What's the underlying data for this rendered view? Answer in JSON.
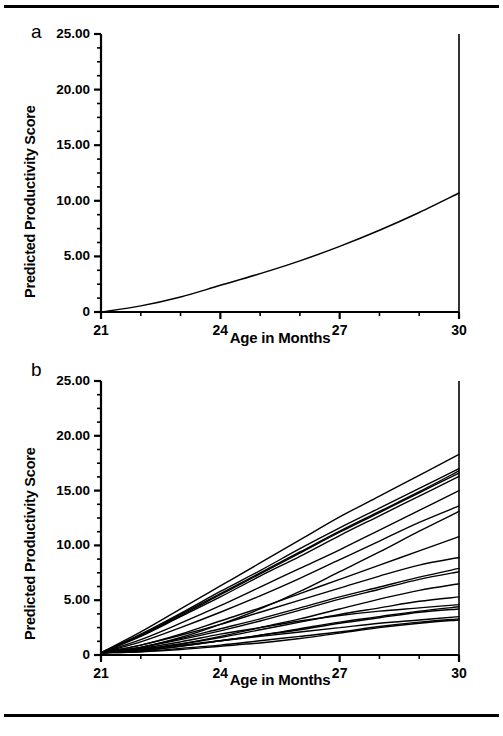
{
  "figure": {
    "panel_a_letter": "a",
    "panel_b_letter": "b"
  },
  "chart_data": [
    {
      "type": "line",
      "panel": "a",
      "title": "",
      "xlabel": "Age in Months",
      "ylabel": "Predicted Productivity Score",
      "xlim": [
        21,
        30
      ],
      "ylim": [
        0,
        25
      ],
      "xticks": [
        21,
        24,
        27,
        30
      ],
      "xtick_labels": [
        "21",
        "24",
        "27",
        "30"
      ],
      "yticks": [
        0,
        5,
        10,
        15,
        20,
        25
      ],
      "ytick_labels": [
        "0",
        "5.00",
        "10.00",
        "15.00",
        "20.00",
        "25.00"
      ],
      "minor_ytick_step": 1.25,
      "grid": false,
      "legend": "none",
      "series": [
        {
          "name": "Mean predicted productivity",
          "x": [
            21,
            22,
            23,
            24,
            25,
            26,
            27,
            28,
            29,
            30
          ],
          "values": [
            0.0,
            0.55,
            1.35,
            2.4,
            3.45,
            4.6,
            5.9,
            7.35,
            8.95,
            10.7
          ]
        }
      ]
    },
    {
      "type": "line",
      "panel": "b",
      "title": "",
      "xlabel": "Age in Months",
      "ylabel": "Predicted Productivity Score",
      "xlim": [
        21,
        30
      ],
      "ylim": [
        0,
        25
      ],
      "xticks": [
        21,
        24,
        27,
        30
      ],
      "xtick_labels": [
        "21",
        "24",
        "27",
        "30"
      ],
      "yticks": [
        0,
        5,
        10,
        15,
        20,
        25
      ],
      "ytick_labels": [
        "0",
        "5.00",
        "10.00",
        "15.00",
        "20.00",
        "25.00"
      ],
      "minor_ytick_step": 1.25,
      "grid": false,
      "legend": "none",
      "x": [
        21,
        22,
        23,
        24,
        25,
        26,
        27,
        28,
        29,
        30
      ],
      "series": [
        {
          "name": "child-01",
          "values": [
            0.2,
            2.1,
            4.2,
            6.3,
            8.4,
            10.5,
            12.6,
            14.5,
            16.4,
            18.3
          ]
        },
        {
          "name": "child-02",
          "values": [
            0.2,
            1.9,
            3.8,
            5.8,
            7.7,
            9.7,
            11.6,
            13.4,
            15.2,
            17.0
          ]
        },
        {
          "name": "child-03",
          "values": [
            0.2,
            1.8,
            3.7,
            5.6,
            7.5,
            9.4,
            11.3,
            13.1,
            14.9,
            16.8
          ]
        },
        {
          "name": "child-04",
          "values": [
            0.2,
            1.8,
            3.6,
            5.5,
            7.4,
            9.3,
            11.2,
            13.0,
            14.8,
            16.6
          ]
        },
        {
          "name": "child-05",
          "values": [
            0.2,
            1.7,
            3.5,
            5.3,
            7.2,
            9.0,
            10.9,
            12.7,
            14.5,
            16.3
          ]
        },
        {
          "name": "child-06",
          "values": [
            0.2,
            1.4,
            2.9,
            4.5,
            6.2,
            7.9,
            9.6,
            11.4,
            13.2,
            15.0
          ]
        },
        {
          "name": "child-07",
          "values": [
            0.2,
            1.2,
            2.5,
            3.9,
            5.4,
            7.0,
            8.7,
            10.4,
            12.1,
            13.6
          ]
        },
        {
          "name": "child-08",
          "values": [
            0.2,
            0.7,
            1.6,
            2.8,
            4.2,
            5.8,
            7.6,
            9.4,
            11.3,
            13.1
          ]
        },
        {
          "name": "child-09",
          "values": [
            0.2,
            0.9,
            1.9,
            3.1,
            4.3,
            5.6,
            6.9,
            8.2,
            9.5,
            10.8
          ]
        },
        {
          "name": "child-10",
          "values": [
            0.2,
            0.9,
            1.8,
            2.8,
            3.9,
            5.0,
            6.1,
            7.2,
            8.2,
            8.9
          ]
        },
        {
          "name": "child-11",
          "values": [
            0.2,
            0.7,
            1.5,
            2.4,
            3.3,
            4.3,
            5.3,
            6.2,
            7.1,
            7.9
          ]
        },
        {
          "name": "child-12",
          "values": [
            0.2,
            0.7,
            1.4,
            2.2,
            3.1,
            4.1,
            5.1,
            6.0,
            6.9,
            7.6
          ]
        },
        {
          "name": "child-13",
          "values": [
            0.2,
            0.5,
            1.0,
            1.7,
            2.5,
            3.3,
            4.2,
            5.1,
            5.9,
            6.5
          ]
        },
        {
          "name": "child-14",
          "values": [
            0.2,
            0.5,
            1.0,
            1.6,
            2.3,
            3.0,
            3.7,
            4.3,
            4.9,
            5.3
          ]
        },
        {
          "name": "child-15",
          "values": [
            0.2,
            0.6,
            1.2,
            1.9,
            2.5,
            3.1,
            3.6,
            4.0,
            4.3,
            4.6
          ]
        },
        {
          "name": "child-16",
          "values": [
            0.2,
            0.4,
            0.8,
            1.3,
            1.8,
            2.4,
            3.0,
            3.5,
            4.0,
            4.4
          ]
        },
        {
          "name": "child-17",
          "values": [
            0.2,
            0.4,
            0.8,
            1.3,
            1.8,
            2.3,
            2.9,
            3.4,
            3.9,
            4.2
          ]
        },
        {
          "name": "child-18",
          "values": [
            0.2,
            0.5,
            0.9,
            1.3,
            1.7,
            2.1,
            2.5,
            2.9,
            3.2,
            3.5
          ]
        },
        {
          "name": "child-19",
          "values": [
            0.2,
            0.3,
            0.6,
            0.9,
            1.3,
            1.7,
            2.1,
            2.6,
            3.0,
            3.3
          ]
        },
        {
          "name": "child-20",
          "values": [
            0.2,
            0.3,
            0.5,
            0.8,
            1.1,
            1.5,
            2.0,
            2.5,
            2.9,
            3.2
          ]
        }
      ]
    }
  ]
}
